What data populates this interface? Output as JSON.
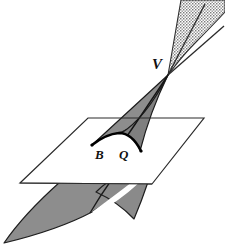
{
  "figure": {
    "background_color": "#ffffff",
    "width": 225,
    "height": 248,
    "labels": {
      "vertex": "V",
      "point_b": "B",
      "point_q": "Q"
    },
    "colors": {
      "outline": "#1a1a1a",
      "plane_fill": "#ffffff",
      "plane_stroke": "#2b2b2b",
      "nappe_solid_fill": "#8d8d8d",
      "nappe_solid_fill_dark": "#7a7a7a",
      "nappe_stipple_fill": "#b4b4b4",
      "curve_stroke": "#000000",
      "label_color": "#111111"
    },
    "geometry": {
      "apex": {
        "x": 168,
        "y": 75
      },
      "plane_corners": [
        {
          "x": 88,
          "y": 118
        },
        {
          "x": 204,
          "y": 118
        },
        {
          "x": 152,
          "y": 184
        },
        {
          "x": 20,
          "y": 183
        }
      ],
      "base_curve_endpoints": [
        {
          "x": 92,
          "y": 144
        },
        {
          "x": 140,
          "y": 151
        }
      ],
      "base_curve_apex": {
        "x": 117,
        "y": 133
      },
      "upper_nappe_fan_lines": 2,
      "lower_nappe_fan_lines": 1
    },
    "elements": {
      "upper_nappe": "upper-nappe-stippled",
      "mid_nappe": "mid-nappe-solid",
      "plane": "plane-parallelogram",
      "base_curve": "base-curve",
      "lower_nappe": "lower-nappe-solid"
    }
  }
}
